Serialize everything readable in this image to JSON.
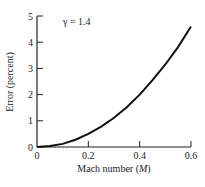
{
  "chart_data": {
    "type": "line",
    "title": "",
    "annotation": "γ = 1.4",
    "xlabel": "Mach number (M)",
    "ylabel": "Error (percent)",
    "xlim": [
      0,
      0.6
    ],
    "ylim": [
      0,
      5
    ],
    "x_ticks": [
      "0",
      "0.2",
      "0.4",
      "0.6"
    ],
    "y_ticks": [
      "0",
      "1",
      "2",
      "3",
      "4",
      "5"
    ],
    "grid": false,
    "legend": null,
    "series": [
      {
        "name": "γ = 1.4",
        "x": [
          0,
          0.05,
          0.1,
          0.15,
          0.2,
          0.25,
          0.3,
          0.35,
          0.4,
          0.45,
          0.5,
          0.55,
          0.6
        ],
        "y": [
          0,
          0.04,
          0.12,
          0.28,
          0.5,
          0.78,
          1.12,
          1.52,
          2.0,
          2.55,
          3.15,
          3.82,
          4.6
        ]
      }
    ]
  },
  "labels": {
    "annotation": "γ = 1.4",
    "xlabel_prefix": "Mach number (",
    "xlabel_var": "M",
    "xlabel_suffix": ")",
    "ylabel": "Error (percent)"
  }
}
